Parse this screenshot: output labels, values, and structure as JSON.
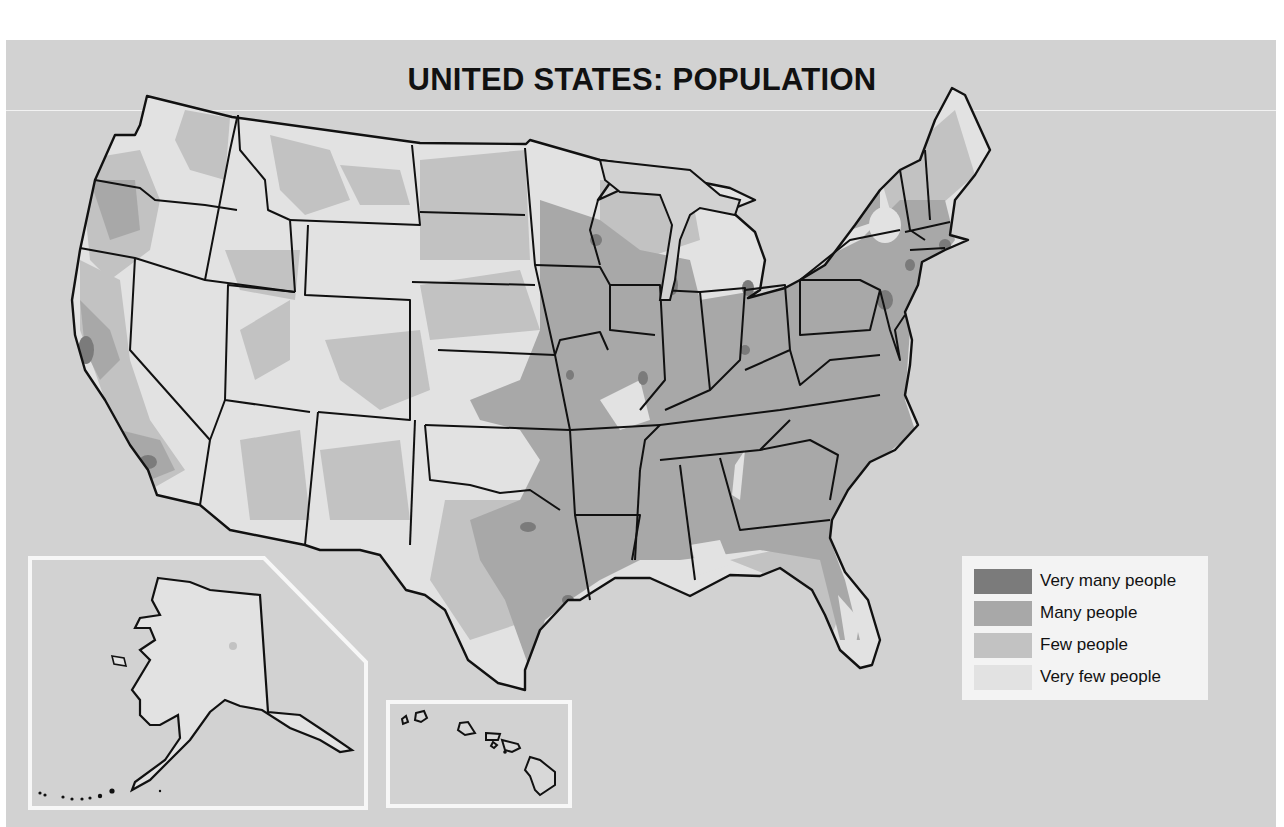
{
  "map": {
    "title": "UNITED STATES: POPULATION",
    "insets": [
      "Alaska",
      "Hawaii"
    ],
    "colors": {
      "background": "#d2d2d2",
      "very_many": "#7b7b7b",
      "many": "#a8a8a8",
      "few": "#c2c2c2",
      "very_few": "#e2e2e2",
      "border": "#111111"
    }
  },
  "legend": {
    "items": [
      {
        "label": "Very many people",
        "color": "#7b7b7b"
      },
      {
        "label": "Many people",
        "color": "#a8a8a8"
      },
      {
        "label": "Few people",
        "color": "#c2c2c2"
      },
      {
        "label": "Very few people",
        "color": "#e2e2e2"
      }
    ]
  }
}
